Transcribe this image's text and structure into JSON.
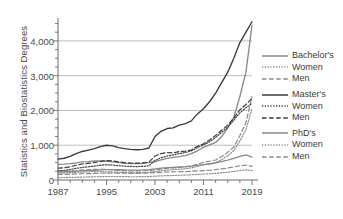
{
  "chart_data": {
    "type": "line",
    "title": "",
    "xlabel": "",
    "ylabel": "Statistics and Biostatistics Degrees",
    "xlim": [
      1987,
      2019
    ],
    "ylim": [
      0,
      4600
    ],
    "grid": "horizontal",
    "legend_position": "right",
    "xticks": [
      "1987",
      "1995",
      "2003",
      "2011",
      "2019"
    ],
    "xtick_values": [
      1987,
      1995,
      2003,
      2011,
      2019
    ],
    "xminor_step": 2,
    "yticks": [
      "0",
      "1,000",
      "2,000",
      "3,000",
      "4,000"
    ],
    "ytick_values": [
      0,
      1000,
      2000,
      3000,
      4000
    ],
    "x": [
      1987,
      1988,
      1989,
      1990,
      1991,
      1992,
      1993,
      1994,
      1995,
      1996,
      1997,
      1998,
      1999,
      2000,
      2001,
      2002,
      2003,
      2004,
      2005,
      2006,
      2007,
      2008,
      2009,
      2010,
      2011,
      2012,
      2013,
      2014,
      2015,
      2016,
      2017,
      2018,
      2019
    ],
    "series": [
      {
        "name": "Bachelor's",
        "style": "solid",
        "color": "#8a8a8a",
        "values": [
          450,
          455,
          470,
          490,
          520,
          530,
          545,
          545,
          540,
          520,
          500,
          480,
          470,
          470,
          480,
          500,
          530,
          580,
          620,
          650,
          670,
          700,
          760,
          840,
          940,
          1010,
          1080,
          1250,
          1500,
          1800,
          2400,
          3100,
          4450
        ]
      },
      {
        "name": "Bachelor's Women",
        "style": "dotted",
        "color": "#8a8a8a",
        "values": [
          200,
          205,
          210,
          220,
          230,
          235,
          240,
          240,
          235,
          230,
          225,
          215,
          210,
          210,
          215,
          225,
          240,
          265,
          285,
          300,
          310,
          325,
          350,
          390,
          435,
          470,
          505,
          580,
          700,
          850,
          1120,
          1450,
          2050
        ]
      },
      {
        "name": "Bachelor's Men",
        "style": "dashed",
        "color": "#8a8a8a",
        "values": [
          250,
          250,
          260,
          270,
          290,
          295,
          305,
          305,
          305,
          290,
          275,
          265,
          260,
          260,
          265,
          275,
          290,
          315,
          335,
          350,
          360,
          375,
          410,
          450,
          505,
          540,
          575,
          670,
          800,
          950,
          1280,
          1650,
          2400
        ]
      },
      {
        "name": "Master's",
        "style": "solid",
        "color": "#3a3a3a",
        "values": [
          600,
          625,
          680,
          760,
          820,
          860,
          900,
          960,
          1000,
          980,
          930,
          900,
          880,
          870,
          880,
          920,
          1250,
          1400,
          1480,
          1500,
          1580,
          1620,
          1700,
          1900,
          2050,
          2250,
          2500,
          2800,
          3100,
          3500,
          3950,
          4250,
          4550
        ]
      },
      {
        "name": "Master's Women",
        "style": "dotted",
        "color": "#3a3a3a",
        "values": [
          260,
          275,
          300,
          335,
          360,
          380,
          400,
          425,
          440,
          430,
          410,
          400,
          390,
          385,
          390,
          410,
          560,
          640,
          690,
          720,
          760,
          790,
          840,
          930,
          1010,
          1100,
          1220,
          1370,
          1520,
          1720,
          1930,
          2080,
          2200
        ]
      },
      {
        "name": "Master's Men",
        "style": "dashed",
        "color": "#3a3a3a",
        "values": [
          340,
          350,
          380,
          425,
          460,
          480,
          500,
          535,
          560,
          550,
          520,
          500,
          490,
          485,
          490,
          510,
          690,
          760,
          790,
          780,
          820,
          830,
          860,
          970,
          1040,
          1150,
          1280,
          1430,
          1580,
          1780,
          2020,
          2170,
          2350
        ]
      },
      {
        "name": "PhD's",
        "style": "solid",
        "color": "#8a8a8a",
        "values": [
          230,
          235,
          245,
          255,
          265,
          270,
          280,
          290,
          300,
          300,
          295,
          290,
          285,
          285,
          290,
          300,
          320,
          340,
          355,
          365,
          375,
          385,
          400,
          420,
          440,
          460,
          490,
          530,
          570,
          620,
          680,
          720,
          660
        ]
      },
      {
        "name": "PhD's Women",
        "style": "dotted",
        "color": "#8a8a8a",
        "values": [
          70,
          72,
          76,
          80,
          85,
          88,
          92,
          96,
          100,
          100,
          98,
          96,
          94,
          94,
          96,
          100,
          110,
          118,
          125,
          130,
          136,
          142,
          150,
          160,
          170,
          180,
          192,
          208,
          225,
          246,
          272,
          292,
          270
        ]
      },
      {
        "name": "PhD's Men",
        "style": "dashed",
        "color": "#8a8a8a",
        "values": [
          160,
          163,
          169,
          175,
          180,
          182,
          188,
          194,
          200,
          200,
          197,
          194,
          191,
          191,
          194,
          200,
          210,
          222,
          230,
          235,
          239,
          243,
          250,
          260,
          270,
          280,
          298,
          322,
          345,
          374,
          408,
          428,
          390
        ]
      }
    ]
  },
  "legend": {
    "entries": [
      {
        "label": "Bachelor's",
        "style": "solid",
        "color": "#8a8a8a",
        "group_start": true
      },
      {
        "label": "Women",
        "style": "dotted",
        "color": "#8a8a8a",
        "group_start": false
      },
      {
        "label": "Men",
        "style": "dashed",
        "color": "#8a8a8a",
        "group_start": false
      },
      {
        "label": "Master's",
        "style": "solid",
        "color": "#3a3a3a",
        "group_start": true
      },
      {
        "label": "Women",
        "style": "dotted",
        "color": "#3a3a3a",
        "group_start": false
      },
      {
        "label": "Men",
        "style": "dashed",
        "color": "#3a3a3a",
        "group_start": false
      },
      {
        "label": "PhD's",
        "style": "solid",
        "color": "#8a8a8a",
        "group_start": true
      },
      {
        "label": "Women",
        "style": "dotted",
        "color": "#8a8a8a",
        "group_start": false
      },
      {
        "label": "Men",
        "style": "dashed",
        "color": "#8a8a8a",
        "group_start": false
      }
    ]
  },
  "colors": {
    "axis": "#6b6b6b",
    "grid": "#b8b8b8",
    "text": "#4a4a4a",
    "light_series": "#8a8a8a",
    "dark_series": "#3a3a3a"
  }
}
